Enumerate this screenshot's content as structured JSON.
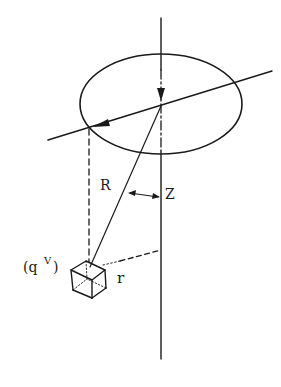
{
  "diagram": {
    "labels": {
      "source": "(q",
      "source_sup": "V",
      "source_close": ")",
      "R": "R",
      "Z": "Z",
      "r": "r"
    },
    "colors": {
      "ink": "#1a1a1a",
      "background": "#ffffff"
    },
    "elements": [
      "vertical-axis",
      "horizontal-disk-ellipse",
      "inclined-axis-line",
      "radius-vector-R",
      "volume-element-cube",
      "distance-r-dashed-line",
      "Z-angle-arrow"
    ]
  }
}
